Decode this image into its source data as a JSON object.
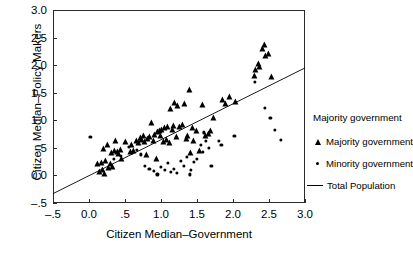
{
  "chart_data": {
    "type": "scatter",
    "title": "",
    "xlabel": "Citizen Median–Government",
    "ylabel": "Citizen Median–Policy Makers",
    "xlim": [
      -0.5,
      3.0
    ],
    "ylim": [
      -0.5,
      3.0
    ],
    "grid": false,
    "legend_position": "right",
    "legend_title": "Majority government",
    "xticks": [
      "–.5",
      "0.0",
      ".5",
      "1.0",
      "1.5",
      "2.0",
      "2.5",
      "3.0"
    ],
    "xtick_values": [
      -0.5,
      0.0,
      0.5,
      1.0,
      1.5,
      2.0,
      2.5,
      3.0
    ],
    "yticks": [
      "–.5",
      "0.0",
      ".5",
      "1.0",
      "1.5",
      "2.0",
      "2.5",
      "3.0"
    ],
    "ytick_values": [
      -0.5,
      0.0,
      0.5,
      1.0,
      1.5,
      2.0,
      2.5,
      3.0
    ],
    "series": [
      {
        "name": "Majority government",
        "marker": "triangle",
        "color": "#000000",
        "points": [
          [
            0.13,
            0.2
          ],
          [
            0.15,
            0.06
          ],
          [
            0.18,
            0.22
          ],
          [
            0.19,
            0.1
          ],
          [
            0.21,
            0.48
          ],
          [
            0.22,
            0.02
          ],
          [
            0.24,
            0.27
          ],
          [
            0.26,
            0.55
          ],
          [
            0.28,
            0.14
          ],
          [
            0.3,
            0.2
          ],
          [
            0.32,
            0.4
          ],
          [
            0.34,
            0.16
          ],
          [
            0.36,
            0.45
          ],
          [
            0.38,
            0.62
          ],
          [
            0.4,
            0.42
          ],
          [
            0.42,
            0.38
          ],
          [
            0.44,
            0.46
          ],
          [
            0.46,
            0.3
          ],
          [
            0.52,
            0.6
          ],
          [
            0.58,
            0.42
          ],
          [
            0.6,
            0.55
          ],
          [
            0.63,
            0.45
          ],
          [
            0.66,
            0.62
          ],
          [
            0.7,
            0.58
          ],
          [
            0.72,
            0.68
          ],
          [
            0.74,
            0.64
          ],
          [
            0.76,
            0.72
          ],
          [
            0.78,
            0.6
          ],
          [
            0.8,
            0.37
          ],
          [
            0.82,
            0.66
          ],
          [
            0.85,
            0.7
          ],
          [
            0.88,
            0.95
          ],
          [
            0.9,
            0.62
          ],
          [
            0.92,
            0.74
          ],
          [
            0.94,
            0.3
          ],
          [
            0.96,
            0.78
          ],
          [
            0.98,
            0.8
          ],
          [
            1.0,
            0.72
          ],
          [
            1.02,
            0.83
          ],
          [
            1.04,
            0.6
          ],
          [
            1.06,
            0.86
          ],
          [
            1.08,
            0.64
          ],
          [
            1.1,
            0.88
          ],
          [
            1.12,
            0.58
          ],
          [
            1.14,
            1.2
          ],
          [
            1.16,
            0.82
          ],
          [
            1.18,
            0.9
          ],
          [
            1.2,
            1.32
          ],
          [
            1.22,
            0.7
          ],
          [
            1.24,
            1.26
          ],
          [
            1.26,
            0.88
          ],
          [
            1.3,
            0.92
          ],
          [
            1.34,
            1.3
          ],
          [
            1.36,
            0.66
          ],
          [
            1.38,
            0.72
          ],
          [
            1.4,
            1.55
          ],
          [
            1.42,
            0.4
          ],
          [
            1.44,
            0.86
          ],
          [
            1.46,
            0.62
          ],
          [
            1.5,
            0.8
          ],
          [
            1.54,
            0.45
          ],
          [
            1.58,
            1.28
          ],
          [
            1.62,
            0.72
          ],
          [
            1.66,
            0.76
          ],
          [
            1.7,
            0.8
          ],
          [
            1.74,
            1.05
          ],
          [
            1.86,
            1.36
          ],
          [
            1.9,
            1.3
          ],
          [
            1.96,
            1.42
          ],
          [
            2.04,
            1.34
          ],
          [
            2.3,
            1.8
          ],
          [
            2.32,
            1.92
          ],
          [
            2.36,
            2.02
          ],
          [
            2.38,
            1.96
          ],
          [
            2.42,
            2.3
          ],
          [
            2.44,
            2.36
          ],
          [
            2.46,
            2.16
          ],
          [
            2.5,
            2.2
          ],
          [
            2.54,
            1.78
          ]
        ]
      },
      {
        "name": "Minority government",
        "marker": "dot",
        "color": "#000000",
        "points": [
          [
            0.02,
            0.7
          ],
          [
            0.35,
            0.3
          ],
          [
            0.44,
            0.36
          ],
          [
            0.55,
            0.52
          ],
          [
            0.66,
            0.46
          ],
          [
            0.72,
            0.38
          ],
          [
            0.78,
            0.18
          ],
          [
            0.84,
            0.12
          ],
          [
            0.9,
            0.08
          ],
          [
            0.95,
            0.02
          ],
          [
            1.0,
            0.16
          ],
          [
            1.05,
            0.1
          ],
          [
            1.1,
            0.22
          ],
          [
            1.14,
            0.06
          ],
          [
            1.18,
            0.12
          ],
          [
            1.22,
            0.04
          ],
          [
            1.28,
            0.26
          ],
          [
            1.32,
            0.18
          ],
          [
            1.36,
            0.34
          ],
          [
            1.4,
            0.02
          ],
          [
            1.42,
            0.1
          ],
          [
            1.46,
            0.24
          ],
          [
            1.5,
            0.3
          ],
          [
            1.55,
            0.56
          ],
          [
            1.58,
            0.42
          ],
          [
            1.6,
            0.78
          ],
          [
            1.62,
            0.62
          ],
          [
            1.66,
            0.5
          ],
          [
            1.7,
            0.18
          ],
          [
            1.8,
            0.62
          ],
          [
            1.84,
            0.55
          ],
          [
            2.02,
            0.72
          ],
          [
            2.3,
            1.7
          ],
          [
            2.44,
            1.22
          ],
          [
            2.52,
            1.04
          ],
          [
            2.58,
            0.82
          ],
          [
            2.66,
            0.64
          ]
        ]
      }
    ],
    "fit_line": {
      "name": "Total Population",
      "color": "#000000",
      "x": [
        -0.5,
        3.0
      ],
      "y": [
        -0.33,
        1.95
      ],
      "slope": 0.651,
      "intercept": -0.005
    },
    "legend_entries": [
      {
        "label": "Majority government",
        "marker": "triangle"
      },
      {
        "label": "Minority government",
        "marker": "dot"
      },
      {
        "label": "Total Population",
        "marker": "line"
      }
    ]
  }
}
